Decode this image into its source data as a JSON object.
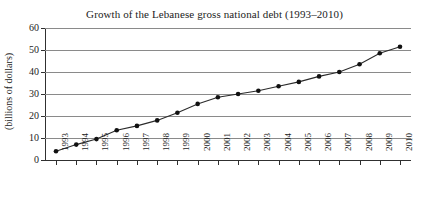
{
  "chart_data": {
    "type": "line",
    "title": "Growth of the Lebanese gross national debt (1993–2010)",
    "xlabel": "",
    "ylabel": "(billions of dollars)",
    "categories": [
      "1993",
      "1994",
      "1995",
      "1996",
      "1997",
      "1998",
      "1999",
      "2000",
      "2001",
      "2002",
      "2003",
      "2004",
      "2005",
      "2006",
      "2007",
      "2008",
      "2009",
      "2010"
    ],
    "values": [
      4,
      7,
      9.5,
      13.5,
      15.5,
      18,
      21.5,
      25.5,
      28.5,
      30,
      31.5,
      33.5,
      35.5,
      38,
      40,
      43.5,
      48.5,
      51.5
    ],
    "ylim": [
      0,
      60
    ],
    "yticks": [
      0,
      10,
      20,
      30,
      40,
      50,
      60
    ],
    "grid": true,
    "legend": "none",
    "marker": "filled-circle",
    "line_color": "#2b2b2b",
    "marker_color": "#111111",
    "grid_color": "#8a8a8a",
    "axis_color": "#303030",
    "background": "#ffffff"
  }
}
